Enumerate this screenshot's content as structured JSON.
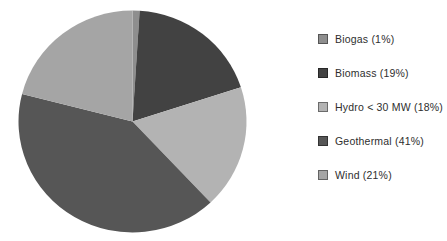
{
  "chart_data": {
    "type": "pie",
    "title": "",
    "labels": [
      "Biogas",
      "Biomass",
      "Hydro < 30 MW",
      "Geothermal",
      "Wind"
    ],
    "values": [
      1,
      19,
      18,
      41,
      21
    ],
    "unit": "%",
    "legend_labels": [
      "Biogas (1%)",
      "Biomass (19%)",
      "Hydro < 30 MW (18%)",
      "Geothermal (41%)",
      "Wind (21%)"
    ],
    "colors": [
      "#8e8e8e",
      "#424242",
      "#b3b3b3",
      "#565656",
      "#a5a5a5"
    ],
    "start_angle_deg": -90,
    "direction": "clockwise",
    "legend_position": "right",
    "background": "#ffffff"
  }
}
